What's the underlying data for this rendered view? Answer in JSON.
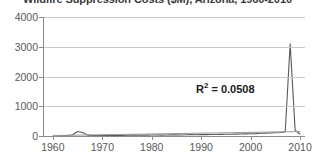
{
  "chart_data": {
    "type": "line",
    "title": "Wildfire Suppression Costs ($M), Arizona, 1960-2010",
    "xlabel": "",
    "ylabel": "",
    "xlim": [
      1958,
      2011
    ],
    "ylim": [
      0,
      4000
    ],
    "grid": true,
    "legend": false,
    "yticks": [
      0,
      1000,
      2000,
      3000,
      4000
    ],
    "ytick_labels": [
      "0",
      "1000",
      "2000",
      "3000",
      "4000"
    ],
    "xticks": [
      1960,
      1970,
      1980,
      1990,
      2000,
      2010
    ],
    "xtick_labels": [
      "1960",
      "1970",
      "1980",
      "1990",
      "2000",
      "2010"
    ],
    "annotations": [
      {
        "text": "R",
        "sup": "2",
        "rest": " = 0.0508",
        "full": "R2 = 0.0508",
        "x": 1997,
        "y": 1150
      }
    ],
    "series": [
      {
        "name": "data",
        "color": "#595959",
        "x": [
          1960,
          1961,
          1962,
          1963,
          1964,
          1965,
          1966,
          1967,
          1968,
          1969,
          1970,
          1971,
          1972,
          1973,
          1974,
          1975,
          1976,
          1977,
          1978,
          1979,
          1980,
          1981,
          1982,
          1983,
          1984,
          1985,
          1986,
          1987,
          1988,
          1989,
          1990,
          1991,
          1992,
          1993,
          1994,
          1995,
          1996,
          1997,
          1998,
          1999,
          2000,
          2001,
          2002,
          2003,
          2004,
          2005,
          2006,
          2007,
          2008,
          2009,
          2010
        ],
        "values": [
          10,
          12,
          14,
          18,
          40,
          150,
          120,
          30,
          20,
          18,
          22,
          25,
          20,
          18,
          22,
          25,
          30,
          28,
          25,
          30,
          35,
          32,
          30,
          35,
          40,
          38,
          35,
          40,
          45,
          42,
          48,
          45,
          50,
          48,
          55,
          60,
          58,
          62,
          65,
          70,
          75,
          80,
          90,
          95,
          100,
          110,
          120,
          140,
          3100,
          200,
          60
        ]
      },
      {
        "name": "trendline",
        "color": "#9a9a9a",
        "x": [
          1960,
          2010
        ],
        "values": [
          15,
          150
        ]
      }
    ],
    "peak": {
      "year": 2008,
      "value": 3100
    },
    "secondary_bump": {
      "year": 1965,
      "value": 150
    }
  },
  "colors": {
    "background": "#ffffff",
    "gridline": "#c9c9c9",
    "axis": "#8c8c8c",
    "tick_label": "#595959",
    "data_line": "#595959",
    "trend_line": "#9a9a9a",
    "annotation": "#1a1a1a",
    "title": "#3a3a3a"
  }
}
